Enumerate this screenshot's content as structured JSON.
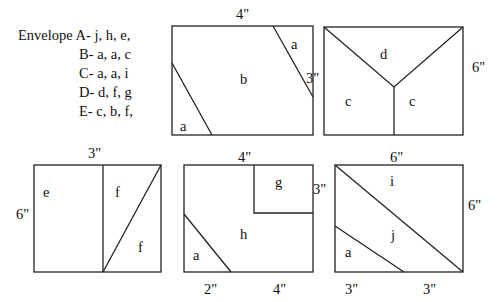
{
  "legend": {
    "prefix": "Envelope",
    "rows": [
      "A- j, h, e,",
      "B- a, a, c",
      "C- a, a, i",
      "D- d, f, g",
      "E- c, b, f,"
    ]
  },
  "panels": [
    {
      "id": "panel1",
      "labels": {
        "top": "4\"",
        "right": "3\""
      },
      "pieces": [
        "a",
        "b",
        "a"
      ]
    },
    {
      "id": "panel2",
      "labels": {
        "right": "6\""
      },
      "pieces": [
        "d",
        "c",
        "c"
      ]
    },
    {
      "id": "panel3",
      "labels": {
        "top": "3\"",
        "left": "6\""
      },
      "pieces": [
        "e",
        "f",
        "f"
      ]
    },
    {
      "id": "panel4",
      "labels": {
        "top": "4\"",
        "right": "3\"",
        "bottom_left": "2\"",
        "bottom_right": "4\""
      },
      "pieces": [
        "g",
        "h",
        "a"
      ]
    },
    {
      "id": "panel5",
      "labels": {
        "top": "6\"",
        "right": "6\"",
        "bottom_left": "3\"",
        "bottom_right": "3\""
      },
      "pieces": [
        "i",
        "j",
        "a"
      ]
    }
  ],
  "colors": {
    "stroke": "#222222",
    "background": "#ffffff"
  }
}
